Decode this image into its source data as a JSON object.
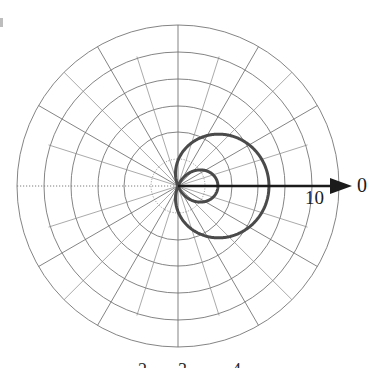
{
  "figure": {
    "background_color": "#ffffff",
    "curve_color": "#4a4a4a",
    "grid_color": "#6e6e6e",
    "axis_color": "#1b1b1b"
  },
  "labels": {
    "radial_tick": "10",
    "axis_angle": "0",
    "bottom_1": "2",
    "bottom_2": "3",
    "bottom_3": "4"
  },
  "chart_data": {
    "type": "line",
    "plot_kind": "polar",
    "title": "",
    "xlabel": "",
    "ylabel": "",
    "equation": "r = a + b*cos(theta), b > a (limacon with inner loop)",
    "center_px": [
      178,
      186
    ],
    "radial_axis": {
      "label": "10",
      "angle_label": "0",
      "max": 10,
      "unit_px_per_division": 16.1,
      "outer_radius_px": 161,
      "grid_circle_count": 6,
      "grid_circle_radii": [
        1.7,
        3.3,
        5.0,
        6.7,
        8.3,
        10.0
      ],
      "grid_circle_radii_px": [
        27,
        54,
        80,
        107,
        134,
        161
      ]
    },
    "angular_axis": {
      "spoke_interval_deg": 30,
      "spoke_angles_deg": [
        0,
        30,
        60,
        90,
        120,
        150,
        180,
        210,
        240,
        270,
        300,
        330
      ],
      "minor_spoke_interval_deg": 15,
      "grid": true,
      "legend": "none"
    },
    "series": [
      {
        "name": "limacon",
        "theta_deg": [
          0,
          15,
          30,
          45,
          60,
          75,
          90,
          105,
          120,
          135,
          150,
          165,
          180,
          195,
          210,
          225,
          240,
          255,
          270,
          285,
          300,
          315,
          330,
          345,
          360
        ],
        "r": [
          5.65,
          5.52,
          5.13,
          4.52,
          3.74,
          2.85,
          1.88,
          0.9,
          -0.03,
          -0.89,
          -1.62,
          -2.16,
          -2.48,
          -2.16,
          -1.62,
          -0.89,
          -0.03,
          0.9,
          1.88,
          2.85,
          3.74,
          4.52,
          5.13,
          5.52,
          5.65
        ],
        "max_r": 5.65,
        "inner_loop_extent": 2.48,
        "passes_through_pole": true
      }
    ]
  }
}
